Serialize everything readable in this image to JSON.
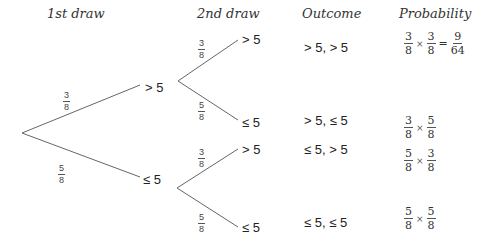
{
  "headers": {
    "first_draw": "1st draw",
    "second_draw": "2nd draw",
    "outcome": "Outcome",
    "probability": "Probability"
  },
  "first_branches": [
    {
      "label": "> 5",
      "prob": {
        "num": "3",
        "den": "8"
      }
    },
    {
      "label": "≤ 5",
      "prob": {
        "num": "5",
        "den": "8"
      }
    }
  ],
  "second_branches": [
    {
      "label": "> 5",
      "prob": {
        "num": "3",
        "den": "8"
      }
    },
    {
      "label": "≤ 5",
      "prob": {
        "num": "5",
        "den": "8"
      }
    },
    {
      "label": "> 5",
      "prob": {
        "num": "3",
        "den": "8"
      }
    },
    {
      "label": "≤ 5",
      "prob": {
        "num": "5",
        "den": "8"
      }
    }
  ],
  "outcomes": [
    {
      "outcome": "> 5, > 5",
      "f1": {
        "num": "3",
        "den": "8"
      },
      "times": "×",
      "f2": {
        "num": "3",
        "den": "8"
      },
      "equals": "=",
      "result": {
        "num": "9",
        "den": "64"
      }
    },
    {
      "outcome": "> 5, ≤ 5",
      "f1": {
        "num": "3",
        "den": "8"
      },
      "times": "×",
      "f2": {
        "num": "5",
        "den": "8"
      }
    },
    {
      "outcome": "≤ 5, > 5",
      "f1": {
        "num": "5",
        "den": "8"
      },
      "times": "×",
      "f2": {
        "num": "3",
        "den": "8"
      }
    },
    {
      "outcome": "≤ 5, ≤ 5",
      "f1": {
        "num": "5",
        "den": "8"
      },
      "times": "×",
      "f2": {
        "num": "5",
        "den": "8"
      }
    }
  ]
}
